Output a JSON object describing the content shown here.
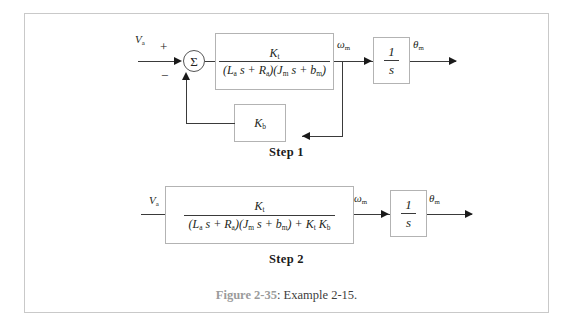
{
  "figure": {
    "caption_number": "Figure 2-35",
    "caption_text": ": Example 2-15."
  },
  "step1": {
    "caption": "Step 1",
    "input_label": "V",
    "input_sub": "a",
    "plus_sign": "+",
    "minus_sign": "−",
    "sum_symbol": "Σ",
    "plant": {
      "numerator": "K",
      "numerator_sub": "t",
      "denominator_part1": "(L",
      "denominator_sub1": "a",
      "denominator_part2": " s + R",
      "denominator_sub2": "a",
      "denominator_part3": ")(J",
      "denominator_sub3": "m",
      "denominator_part4": " s + b",
      "denominator_sub4": "m",
      "denominator_part5": ")"
    },
    "omega_label": "ω",
    "omega_sub": "m",
    "integrator_num": "1",
    "integrator_den": "s",
    "theta_label": "θ",
    "theta_sub": "m",
    "feedback": {
      "label": "K",
      "label_sub": "b"
    }
  },
  "step2": {
    "caption": "Step 2",
    "input_label": "V",
    "input_sub": "a",
    "plant": {
      "numerator": "K",
      "numerator_sub": "t",
      "denominator_part1": "(L",
      "denominator_sub1": "a",
      "denominator_part2": " s + R",
      "denominator_sub2": "a",
      "denominator_part3": ")(J",
      "denominator_sub3": "m",
      "denominator_part4": " s + b",
      "denominator_sub4": "m",
      "denominator_part5": ") + K",
      "denominator_sub5": "t",
      "denominator_part6": " K",
      "denominator_sub6": "b"
    },
    "omega_label": "ω",
    "omega_sub": "m",
    "integrator_num": "1",
    "integrator_den": "s",
    "theta_label": "θ",
    "theta_sub": "m"
  },
  "colors": {
    "frame_border": "#c9c9c9",
    "block_border": "#b3b3b3",
    "line": "#3a3a3a",
    "caption_gray": "#9b9b9b"
  }
}
